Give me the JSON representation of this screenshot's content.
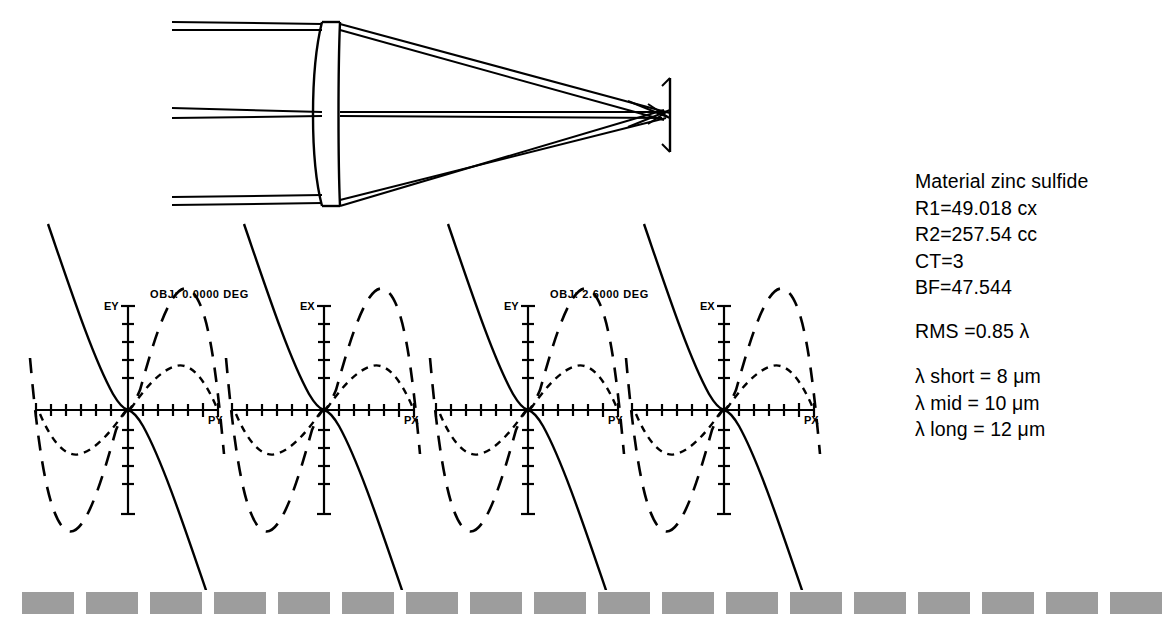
{
  "document": {
    "title": "Singlet lens ray trace and transverse ray aberration fans"
  },
  "lens_diagram": {
    "name": "lens-layout-diagram",
    "description": "Single element lens with collimated input ray bundles converging to image plane",
    "elements": {
      "lens_label": "singlet",
      "image_plane_label": "image plane"
    },
    "ray_bundles": [
      {
        "name": "upper-field-bundle",
        "entry_y": 22
      },
      {
        "name": "axial-bundle",
        "entry_y": 110
      },
      {
        "name": "lower-field-bundle",
        "entry_y": 200
      }
    ]
  },
  "rayfan": {
    "panels": [
      {
        "name": "panel-obj0-tangential",
        "field_label": "OBJ: 0.0000 DEG",
        "show_field_label": true,
        "y_axis_label": "EY",
        "x_axis_label": "PY",
        "x_ticks": 12,
        "y_ticks_up": 5,
        "y_ticks_down": 5
      },
      {
        "name": "panel-obj0-sagittal",
        "field_label": "OBJ: 0.0000 DEG",
        "show_field_label": false,
        "y_axis_label": "EX",
        "x_axis_label": "PX",
        "x_ticks": 12,
        "y_ticks_up": 5,
        "y_ticks_down": 5
      },
      {
        "name": "panel-obj26-tangential",
        "field_label": "OBJ: 2.6000 DEG",
        "show_field_label": true,
        "y_axis_label": "EY",
        "x_axis_label": "PY",
        "x_ticks": 12,
        "y_ticks_up": 5,
        "y_ticks_down": 5
      },
      {
        "name": "panel-obj26-sagittal",
        "field_label": "OBJ: 2.6000 DEG",
        "show_field_label": false,
        "y_axis_label": "EX",
        "x_axis_label": "PX",
        "x_ticks": 12,
        "y_ticks_up": 5,
        "y_ticks_down": 5
      }
    ],
    "curves": [
      {
        "name": "wavelength-mid-curve",
        "style": "solid",
        "wavelength": "10 um"
      },
      {
        "name": "wavelength-long-curve",
        "style": "long-dash",
        "wavelength": "12 um"
      },
      {
        "name": "wavelength-short-curve",
        "style": "short-dash",
        "wavelength": "8 um"
      }
    ]
  },
  "chart_data": {
    "type": "line",
    "xlabel": "Normalized pupil coordinate",
    "ylabel": "Transverse ray error",
    "xlim": [
      -1,
      1
    ],
    "ylim": [
      -1,
      1
    ],
    "grid": false,
    "legend": "none",
    "panels": [
      {
        "field_label": "OBJ: 0.0000 DEG",
        "axes": {
          "y": "EY",
          "x": "PY"
        },
        "series": [
          {
            "name": "mid 10 um",
            "style": "solid",
            "x": [
              -1.0,
              -0.8,
              -0.6,
              -0.4,
              -0.2,
              0.0,
              0.2,
              0.4,
              0.6,
              0.8,
              1.0
            ],
            "y": [
              1.55,
              0.8,
              0.37,
              0.13,
              0.02,
              0.0,
              -0.02,
              -0.13,
              -0.37,
              -0.8,
              -1.55
            ]
          },
          {
            "name": "long 12 um",
            "style": "long-dash",
            "x": [
              -1.0,
              -0.8,
              -0.6,
              -0.4,
              -0.2,
              0.0,
              0.2,
              0.4,
              0.6,
              0.8,
              1.0
            ],
            "y": [
              -0.62,
              -1.02,
              -0.92,
              -0.5,
              -0.14,
              0.0,
              0.14,
              0.5,
              0.92,
              1.02,
              0.62
            ]
          },
          {
            "name": "short 8 um",
            "style": "short-dash",
            "x": [
              -1.0,
              -0.8,
              -0.6,
              -0.4,
              -0.2,
              0.0,
              0.2,
              0.4,
              0.6,
              0.8,
              1.0
            ],
            "y": [
              -0.04,
              -0.26,
              -0.33,
              -0.22,
              -0.07,
              0.0,
              0.07,
              0.22,
              0.33,
              0.26,
              0.04
            ]
          }
        ]
      },
      {
        "field_label": "OBJ: 0.0000 DEG",
        "axes": {
          "y": "EX",
          "x": "PX"
        },
        "series": [
          {
            "name": "mid 10 um",
            "style": "solid",
            "x": [
              -1.0,
              -0.8,
              -0.6,
              -0.4,
              -0.2,
              0.0,
              0.2,
              0.4,
              0.6,
              0.8,
              1.0
            ],
            "y": [
              1.55,
              0.8,
              0.37,
              0.13,
              0.02,
              0.0,
              -0.02,
              -0.13,
              -0.37,
              -0.8,
              -1.55
            ]
          },
          {
            "name": "long 12 um",
            "style": "long-dash",
            "x": [
              -1.0,
              -0.8,
              -0.6,
              -0.4,
              -0.2,
              0.0,
              0.2,
              0.4,
              0.6,
              0.8,
              1.0
            ],
            "y": [
              -0.62,
              -1.02,
              -0.92,
              -0.5,
              -0.14,
              0.0,
              0.14,
              0.5,
              0.92,
              1.02,
              0.62
            ]
          },
          {
            "name": "short 8 um",
            "style": "short-dash",
            "x": [
              -1.0,
              -0.8,
              -0.6,
              -0.4,
              -0.2,
              0.0,
              0.2,
              0.4,
              0.6,
              0.8,
              1.0
            ],
            "y": [
              -0.04,
              -0.26,
              -0.33,
              -0.22,
              -0.07,
              0.0,
              0.07,
              0.22,
              0.33,
              0.26,
              0.04
            ]
          }
        ]
      },
      {
        "field_label": "OBJ: 2.6000 DEG",
        "axes": {
          "y": "EY",
          "x": "PY"
        },
        "series": [
          {
            "name": "mid 10 um",
            "style": "solid",
            "x": [
              -1.0,
              -0.8,
              -0.6,
              -0.4,
              -0.2,
              0.0,
              0.2,
              0.4,
              0.6,
              0.8,
              1.0
            ],
            "y": [
              1.55,
              0.8,
              0.37,
              0.13,
              0.02,
              0.0,
              -0.02,
              -0.13,
              -0.37,
              -0.8,
              -1.55
            ]
          },
          {
            "name": "long 12 um",
            "style": "long-dash",
            "x": [
              -1.0,
              -0.8,
              -0.6,
              -0.4,
              -0.2,
              0.0,
              0.2,
              0.4,
              0.6,
              0.8,
              1.0
            ],
            "y": [
              -0.62,
              -1.02,
              -0.92,
              -0.5,
              -0.14,
              0.0,
              0.14,
              0.5,
              0.92,
              1.02,
              0.62
            ]
          },
          {
            "name": "short 8 um",
            "style": "short-dash",
            "x": [
              -1.0,
              -0.8,
              -0.6,
              -0.4,
              -0.2,
              0.0,
              0.2,
              0.4,
              0.6,
              0.8,
              1.0
            ],
            "y": [
              -0.04,
              -0.26,
              -0.33,
              -0.22,
              -0.07,
              0.0,
              0.07,
              0.22,
              0.33,
              0.26,
              0.04
            ]
          }
        ]
      },
      {
        "field_label": "OBJ: 2.6000 DEG",
        "axes": {
          "y": "EX",
          "x": "PX"
        },
        "series": [
          {
            "name": "mid 10 um",
            "style": "solid",
            "x": [
              -1.0,
              -0.8,
              -0.6,
              -0.4,
              -0.2,
              0.0,
              0.2,
              0.4,
              0.6,
              0.8,
              1.0
            ],
            "y": [
              1.55,
              0.8,
              0.37,
              0.13,
              0.02,
              0.0,
              -0.02,
              -0.13,
              -0.37,
              -0.8,
              -1.55
            ]
          },
          {
            "name": "long 12 um",
            "style": "long-dash",
            "x": [
              -1.0,
              -0.8,
              -0.6,
              -0.4,
              -0.2,
              0.0,
              0.2,
              0.4,
              0.6,
              0.8,
              1.0
            ],
            "y": [
              -0.62,
              -1.02,
              -0.92,
              -0.5,
              -0.14,
              0.0,
              0.14,
              0.5,
              0.92,
              1.02,
              0.62
            ]
          },
          {
            "name": "short 8 um",
            "style": "short-dash",
            "x": [
              -1.0,
              -0.8,
              -0.6,
              -0.4,
              -0.2,
              0.0,
              0.2,
              0.4,
              0.6,
              0.8,
              1.0
            ],
            "y": [
              -0.04,
              -0.26,
              -0.33,
              -0.22,
              -0.07,
              0.0,
              0.07,
              0.22,
              0.33,
              0.26,
              0.04
            ]
          }
        ]
      }
    ]
  },
  "spec": {
    "material": "Material zinc sulfide",
    "r1": "R1=49.018 cx",
    "r2": "R2=257.54 cc",
    "ct": "CT=3",
    "bf": "BF=47.544",
    "rms": "RMS =0.85 λ",
    "wave_short": "λ short = 8 μm",
    "wave_mid": "λ mid = 10 μm",
    "wave_long": "λ long = 12 μm"
  },
  "bottom_bar": {
    "name": "dashed-rule",
    "dash_color": "#9d9d9d",
    "dash_count": 19,
    "dash_width": 52,
    "dash_gap": 12
  },
  "colors": {
    "ink": "#000000",
    "background": "#ffffff",
    "dash_gray": "#9d9d9d"
  }
}
